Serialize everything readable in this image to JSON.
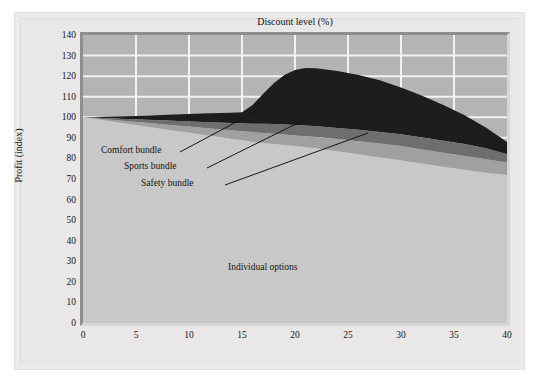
{
  "chart_data": {
    "type": "area",
    "title": "",
    "xlabel": "Discount level (%)",
    "ylabel": "Profit (index)",
    "xlim": [
      0,
      40
    ],
    "ylim": [
      0,
      140
    ],
    "xticks": [
      0,
      5,
      10,
      15,
      20,
      25,
      30,
      35,
      40
    ],
    "yticks": [
      0,
      10,
      20,
      30,
      40,
      50,
      60,
      70,
      80,
      90,
      100,
      110,
      120,
      130,
      140
    ],
    "grid": "vertical and horizontal white gridlines visible only in background above the stacked areas",
    "legend": "inline annotations with leader lines",
    "stacked": true,
    "x": [
      0,
      2,
      4,
      6,
      8,
      10,
      12,
      14,
      15,
      16,
      17,
      18,
      19,
      20,
      21,
      22,
      24,
      26,
      28,
      30,
      32,
      34,
      36,
      38,
      40
    ],
    "series": [
      {
        "name": "Individual options",
        "color": "#c8c8c8",
        "values": [
          100,
          98.5,
          97,
          95.5,
          94,
          92.5,
          91,
          89.5,
          89,
          88,
          87.5,
          87,
          86.5,
          86,
          85.5,
          85,
          83.5,
          82,
          80.5,
          79,
          77.5,
          76,
          74.5,
          73,
          72
        ]
      },
      {
        "name": "Safety bundle",
        "color": "#a0a0a0",
        "cumulative_top": [
          100,
          99.1,
          98.2,
          97.3,
          96.4,
          95.5,
          94.6,
          93.7,
          93.2,
          92.8,
          92.4,
          92.0,
          91.6,
          91.2,
          90.8,
          90.4,
          89.4,
          88.4,
          87.2,
          86.0,
          84.4,
          82.8,
          81.2,
          79.6,
          78.0
        ],
        "values": [
          0,
          0.6,
          1.2,
          1.8,
          2.4,
          3.0,
          3.6,
          4.2,
          4.2,
          4.8,
          4.9,
          5.0,
          5.1,
          5.2,
          5.3,
          5.4,
          5.9,
          6.4,
          6.7,
          7.0,
          6.9,
          6.8,
          6.7,
          6.6,
          6.0
        ]
      },
      {
        "name": "Sports bundle",
        "color": "#6e6e6e",
        "cumulative_top": [
          100,
          99.6,
          99.2,
          98.8,
          98.4,
          98.0,
          97.6,
          97.2,
          97.0,
          96.9,
          96.8,
          96.7,
          96.5,
          96.3,
          96.0,
          95.6,
          94.8,
          94.0,
          92.9,
          91.8,
          90.2,
          88.6,
          87.0,
          85.0,
          82.0
        ],
        "values": [
          0,
          0.5,
          1.0,
          1.5,
          2.0,
          2.5,
          3.0,
          3.5,
          3.8,
          4.1,
          4.4,
          4.7,
          4.9,
          5.1,
          5.2,
          5.2,
          5.4,
          5.6,
          5.7,
          5.8,
          5.8,
          5.8,
          5.8,
          5.4,
          4.0
        ]
      },
      {
        "name": "Comfort bundle",
        "color": "#1d1d1d",
        "cumulative_top": [
          100,
          100.2,
          100.5,
          100.8,
          101.2,
          101.6,
          102.0,
          102.2,
          102.4,
          106.0,
          111.5,
          116.5,
          120.5,
          123.0,
          124.0,
          123.8,
          122.5,
          120.5,
          118.0,
          114.5,
          110.5,
          106.0,
          101.0,
          95.0,
          88.0
        ],
        "values": [
          0,
          0.6,
          1.3,
          2.0,
          2.8,
          3.6,
          4.4,
          5.0,
          5.4,
          9.1,
          14.7,
          19.8,
          24.0,
          26.7,
          28.0,
          28.2,
          27.7,
          26.5,
          25.1,
          22.7,
          20.3,
          17.4,
          14.0,
          10.0,
          6.0
        ]
      }
    ],
    "total_top": [
      100,
      100.2,
      100.5,
      100.8,
      101.2,
      101.6,
      102.0,
      102.2,
      102.4,
      106.0,
      111.5,
      116.5,
      120.5,
      123.0,
      124.0,
      123.8,
      122.5,
      120.5,
      118.0,
      114.5,
      110.5,
      106.0,
      101.0,
      95.0,
      88.0
    ],
    "annotations": [
      {
        "text": "Comfort bundle",
        "x_px": 101,
        "y_px": 145
      },
      {
        "text": "Sports bundle",
        "x_px": 124,
        "y_px": 161
      },
      {
        "text": "Safety bundle",
        "x_px": 141,
        "y_px": 178
      },
      {
        "text": "Individual options",
        "x_px": 228,
        "y_px": 262
      }
    ]
  },
  "axes": {
    "y_title": "Profit (index)",
    "x_title": "Discount level (%)",
    "y_ticks": [
      "140",
      "130",
      "120",
      "110",
      "100",
      "90",
      "80",
      "70",
      "60",
      "50",
      "40",
      "30",
      "20",
      "10",
      "0"
    ],
    "x_ticks": [
      "0",
      "5",
      "10",
      "15",
      "20",
      "25",
      "30",
      "35",
      "40"
    ]
  },
  "annotations": {
    "comfort": "Comfort bundle",
    "sports": "Sports bundle",
    "safety": "Safety bundle",
    "individual": "Individual options"
  },
  "colors": {
    "comfort": "#1d1d1d",
    "sports": "#6e6e6e",
    "safety": "#a0a0a0",
    "individual": "#c8c8c8",
    "plot_background": "#b4b4b4",
    "gridline": "#f2f2f2",
    "page_background": "#ffffff",
    "frame": "#eceaea"
  }
}
